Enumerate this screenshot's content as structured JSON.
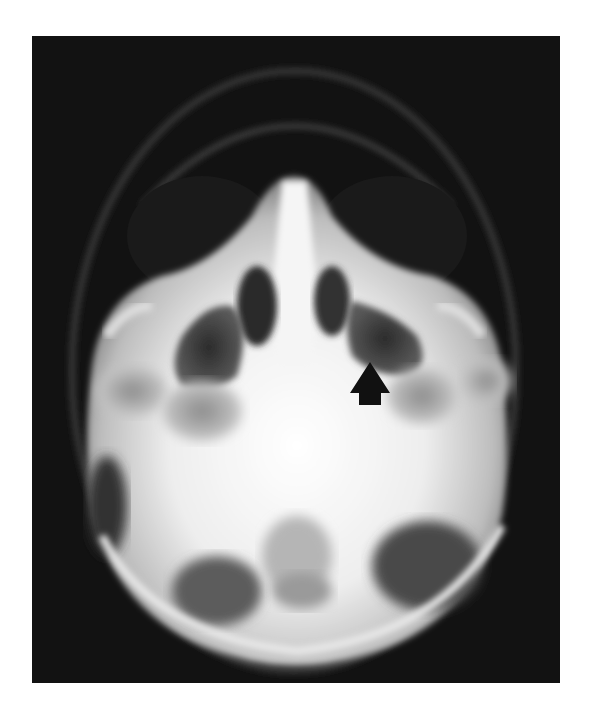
{
  "figure": {
    "type": "radiograph",
    "view": "submentovertex skull radiograph",
    "background_color": "#121212",
    "bone_color": "#f2f2f2",
    "annotation": {
      "kind": "arrow",
      "direction": "up",
      "color": "#111111",
      "tip": [
        370,
        362
      ]
    }
  }
}
